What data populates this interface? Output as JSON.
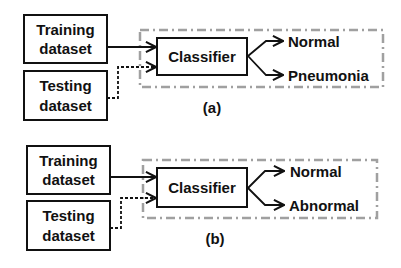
{
  "panels": [
    {
      "id": "a",
      "caption": "(a)",
      "inputs": [
        {
          "line1": "Training",
          "line2": "dataset",
          "connector": "solid"
        },
        {
          "line1": "Testing",
          "line2": "dataset",
          "connector": "dashed"
        }
      ],
      "classifier": "Classifier",
      "outputs": [
        "Normal",
        "Pneumonia"
      ]
    },
    {
      "id": "b",
      "caption": "(b)",
      "inputs": [
        {
          "line1": "Training",
          "line2": "dataset",
          "connector": "solid"
        },
        {
          "line1": "Testing",
          "line2": "dataset",
          "connector": "dashed"
        }
      ],
      "classifier": "Classifier",
      "outputs": [
        "Normal",
        "Abnormal"
      ]
    }
  ],
  "colors": {
    "stroke": "#111111",
    "group_border": "#a0a0a0",
    "background": "#ffffff"
  }
}
